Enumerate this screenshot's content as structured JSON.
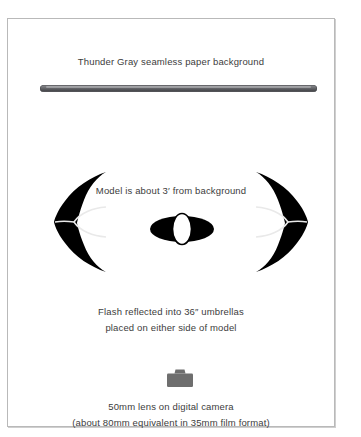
{
  "figure": {
    "type": "lighting-setup-diagram",
    "background_color": "#ffffff",
    "border_color": "#b9b9b9"
  },
  "backdrop": {
    "caption": "Thunder Gray seamless paper background",
    "bar_color_dark": "#4b4c50",
    "bar_color_light": "#8f9094"
  },
  "model": {
    "caption": "Model is about 3′ from background",
    "body_color": "#000000",
    "head_fill": "#ffffff"
  },
  "umbrellas": {
    "caption_line1": "Flash reflected into 36″ umbrellas",
    "caption_line2": "placed on either side of model",
    "fill_color": "#000000",
    "rib_color": "#e8e8e8",
    "left_label": "left-umbrella",
    "right_label": "right-umbrella"
  },
  "camera": {
    "caption_line1": "50mm lens on digital camera",
    "caption_line2": "(about 80mm equivalent in 35mm film format)",
    "icon_color": "#6e6e6e",
    "icon_name": "camera-icon"
  }
}
